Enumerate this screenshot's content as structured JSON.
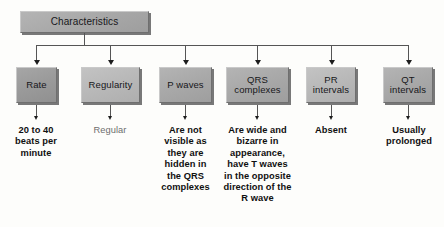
{
  "diagram": {
    "title": "Characteristics",
    "type": "flowchart",
    "root": {
      "label": "Characteristics"
    },
    "columns": [
      {
        "id": "rate",
        "box_label": "Rate",
        "caption": "20 to 40 beats per minute",
        "caption_style": "bold"
      },
      {
        "id": "regularity",
        "box_label": "Regularity",
        "caption": "Regular",
        "caption_style": "muted"
      },
      {
        "id": "p-waves",
        "box_label": "P waves",
        "caption": "Are not visible as they are hidden in the QRS complexes",
        "caption_style": "bold"
      },
      {
        "id": "qrs-complexes",
        "box_label": "QRS complexes",
        "caption": "Are wide and bizarre in appearance, have T waves in the opposite direction of the R wave",
        "caption_style": "bold"
      },
      {
        "id": "pr-intervals",
        "box_label": "PR intervals",
        "caption": "Absent",
        "caption_style": "bold"
      },
      {
        "id": "qt-intervals",
        "box_label": "QT intervals",
        "caption": "Usually prolonged",
        "caption_style": "bold"
      }
    ]
  },
  "colors": {
    "background": "#fdfdfb",
    "box_fill": "#aeaeae",
    "box_shadow": "#5a5a5a",
    "connector": "#555555",
    "arrow": "#1d1d1d",
    "text": "#101010",
    "muted_text": "#6d6d6d"
  }
}
